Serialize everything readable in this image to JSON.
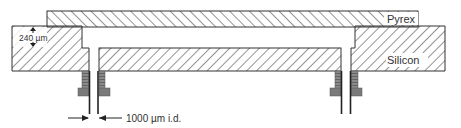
{
  "diagram": {
    "type": "cross-section",
    "labels": {
      "pyrex": "Pyrex",
      "silicon": "Silicon",
      "thickness": "240 µm",
      "tube_id": "1000 µm i.d."
    },
    "colors": {
      "outline": "#333333",
      "hatch": "#3a3a3a",
      "fitting": "#7a7a7a",
      "fitting_dark": "#555555",
      "tube": "#222222",
      "background": "#ffffff"
    },
    "components": [
      {
        "name": "pyrex-cover",
        "material": "Pyrex"
      },
      {
        "name": "silicon-substrate-left",
        "material": "Silicon"
      },
      {
        "name": "silicon-membrane",
        "material": "Silicon"
      },
      {
        "name": "silicon-substrate-right",
        "material": "Silicon"
      },
      {
        "name": "fitting-left",
        "material": "fitting"
      },
      {
        "name": "fitting-right",
        "material": "fitting"
      },
      {
        "name": "tube-left",
        "material": "tube"
      },
      {
        "name": "tube-right",
        "material": "tube"
      }
    ]
  }
}
